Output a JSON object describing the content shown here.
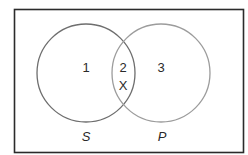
{
  "diagram": {
    "type": "venn",
    "universe": {
      "x": 14,
      "y": 9,
      "width": 229,
      "height": 143,
      "stroke": "#2b2b2b"
    },
    "sets": [
      {
        "name": "S",
        "cx": 86,
        "cy": 73,
        "r": 49,
        "stroke": "#6e6e6e"
      },
      {
        "name": "P",
        "cx": 161,
        "cy": 73,
        "r": 49,
        "stroke": "#9c9c9c"
      }
    ],
    "regions": [
      {
        "id": "1",
        "label": "1",
        "x": 86,
        "y": 67
      },
      {
        "id": "2",
        "label": "2",
        "x": 123,
        "y": 67
      },
      {
        "id": "x-mark",
        "label": "X",
        "x": 123,
        "y": 85
      },
      {
        "id": "3",
        "label": "3",
        "x": 161,
        "y": 67
      }
    ],
    "set_labels": [
      {
        "label": "S",
        "x": 86,
        "y": 136
      },
      {
        "label": "P",
        "x": 162,
        "y": 136
      }
    ]
  }
}
